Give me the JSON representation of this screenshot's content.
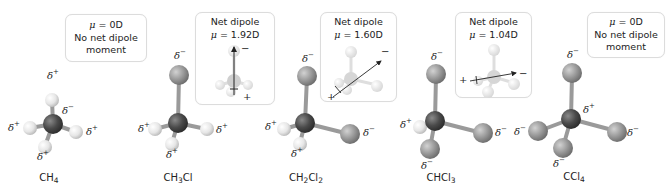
{
  "figure": {
    "molecules": [
      {
        "id": "ch4",
        "formula_parts": [
          "CH",
          "4",
          ""
        ],
        "formula": "CH4",
        "info_box": {
          "lines": [
            "μ = 0D",
            "No net dipole",
            "moment"
          ],
          "mu": "μ",
          "mu_rest": " = 0D",
          "line2": "No net dipole",
          "line3": "moment"
        },
        "partial_charges": [
          {
            "position": "top-H",
            "symbol": "δ",
            "sign": "+"
          },
          {
            "position": "carbon",
            "symbol": "δ",
            "sign": "−"
          },
          {
            "position": "left-H",
            "symbol": "δ",
            "sign": "+"
          },
          {
            "position": "right-H",
            "symbol": "δ",
            "sign": "+"
          },
          {
            "position": "bottom-H",
            "symbol": "δ",
            "sign": "+"
          }
        ]
      },
      {
        "id": "ch3cl",
        "formula_parts": [
          "CH",
          "3",
          "Cl"
        ],
        "formula": "CH3Cl",
        "info_box": {
          "title": "Net dipole",
          "mu": "μ",
          "mu_rest": " = 1.92D",
          "arrow_plus": "+",
          "arrow_minus": "−"
        },
        "partial_charges": [
          {
            "position": "top-Cl",
            "symbol": "δ",
            "sign": "−"
          },
          {
            "position": "left-H",
            "symbol": "δ",
            "sign": "+"
          },
          {
            "position": "right-H",
            "symbol": "δ",
            "sign": "+"
          },
          {
            "position": "bottom-H",
            "symbol": "δ",
            "sign": "+"
          }
        ]
      },
      {
        "id": "ch2cl2",
        "formula_parts": [
          "CH",
          "2",
          "Cl",
          "2"
        ],
        "formula": "CH2Cl2",
        "info_box": {
          "title": "Net dipole",
          "mu": "μ",
          "mu_rest": " = 1.60D",
          "arrow_plus": "+",
          "arrow_minus": "−"
        },
        "partial_charges": [
          {
            "position": "top-Cl",
            "symbol": "δ",
            "sign": "−"
          },
          {
            "position": "left-H",
            "symbol": "δ",
            "sign": "+"
          },
          {
            "position": "right-Cl",
            "symbol": "δ",
            "sign": "−"
          },
          {
            "position": "bottom-H",
            "symbol": "δ",
            "sign": "+"
          }
        ]
      },
      {
        "id": "chcl3",
        "formula_parts": [
          "CHCl",
          "3"
        ],
        "formula": "CHCl3",
        "info_box": {
          "title": "Net dipole",
          "mu": "μ",
          "mu_rest": " = 1.04D",
          "arrow_plus": "+",
          "arrow_minus": "−"
        },
        "partial_charges": [
          {
            "position": "top-Cl",
            "symbol": "δ",
            "sign": "−"
          },
          {
            "position": "left-H",
            "symbol": "δ",
            "sign": "+"
          },
          {
            "position": "right-Cl",
            "symbol": "δ",
            "sign": "−"
          },
          {
            "position": "bottom-Cl",
            "symbol": "δ",
            "sign": "−"
          }
        ]
      },
      {
        "id": "ccl4",
        "formula_parts": [
          "CCl",
          "4"
        ],
        "formula": "CCl4",
        "info_box": {
          "mu": "μ",
          "mu_rest": " = 0D",
          "line2": "No net dipole",
          "line3": "moment"
        },
        "partial_charges": [
          {
            "position": "top-Cl",
            "symbol": "δ",
            "sign": "−"
          },
          {
            "position": "carbon",
            "symbol": "δ",
            "sign": "+"
          },
          {
            "position": "left-Cl",
            "symbol": "δ",
            "sign": "−"
          },
          {
            "position": "right-Cl",
            "symbol": "δ",
            "sign": "−"
          },
          {
            "position": "bottom-Cl",
            "symbol": "δ",
            "sign": "−"
          }
        ]
      }
    ],
    "colors": {
      "carbon": "#4a4a4a",
      "chlorine": "#8c8c8c",
      "hydrogen": "#e8e8e8",
      "bond": "#9a9a9a",
      "box_border": "#dcdcdc",
      "text": "#222222"
    }
  }
}
